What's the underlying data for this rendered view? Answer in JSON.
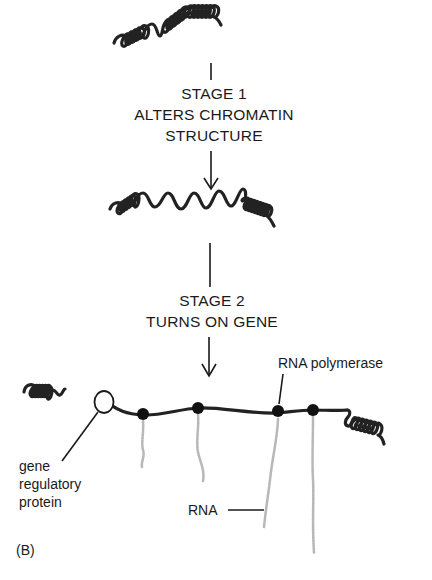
{
  "figure": {
    "panel_label": "(B)",
    "stage1": {
      "line1": "STAGE 1",
      "line2": "ALTERS CHROMATIN",
      "line3": "STRUCTURE"
    },
    "stage2": {
      "line1": "STAGE 2",
      "line2": "TURNS ON GENE"
    },
    "labels": {
      "rna_polymerase": "RNA polymerase",
      "rna": "RNA",
      "gene_regulatory_line1": "gene",
      "gene_regulatory_line2": "regulatory",
      "gene_regulatory_line3": "protein"
    },
    "states": [
      {
        "name": "condensed-chromatin",
        "description": "fully coiled DNA"
      },
      {
        "name": "decondensed-chromatin",
        "description": "partially uncoiled DNA, open central region"
      },
      {
        "name": "active-gene",
        "description": "uncoiled DNA with gene regulatory protein and 4 RNA polymerases transcribing RNA"
      }
    ],
    "polymerase_count": 4,
    "colors": {
      "dna": "#222222",
      "rna": "#b8b8b8",
      "text": "#1a1a1a",
      "background": "#ffffff"
    }
  }
}
